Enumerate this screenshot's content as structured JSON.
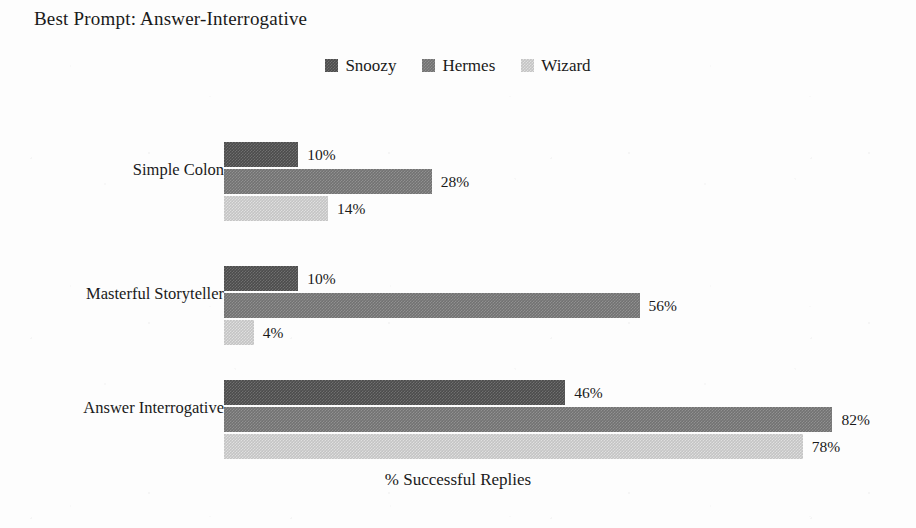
{
  "chart_data": {
    "type": "bar",
    "orientation": "horizontal",
    "title": "Best Prompt: Answer-Interrogative",
    "xlabel": "% Successful Replies",
    "ylabel": "",
    "xlim": [
      0,
      90
    ],
    "grid": false,
    "legend_position": "top-center",
    "value_label_suffix": "%",
    "categories": [
      "Simple Colon",
      "Masterful Storyteller",
      "Answer Interrogative"
    ],
    "series": [
      {
        "name": "Snoozy",
        "color": "#4c4c4c",
        "values": [
          10,
          28,
          46
        ]
      },
      {
        "name": "Hermes",
        "color": "#727272",
        "values": [
          10,
          56,
          82
        ]
      },
      {
        "name": "Wizard",
        "color": "#c4c4c4",
        "values": [
          14,
          4,
          78
        ]
      }
    ],
    "groups": [
      {
        "category": "Simple Colon",
        "bars": [
          {
            "series": "Snoozy",
            "value": 10,
            "label": "10%"
          },
          {
            "series": "Hermes",
            "value": 28,
            "label": "28%"
          },
          {
            "series": "Wizard",
            "value": 14,
            "label": "14%"
          }
        ]
      },
      {
        "category": "Masterful Storyteller",
        "bars": [
          {
            "series": "Snoozy",
            "value": 10,
            "label": "10%"
          },
          {
            "series": "Hermes",
            "value": 56,
            "label": "56%"
          },
          {
            "series": "Wizard",
            "value": 4,
            "label": "4%"
          }
        ]
      },
      {
        "category": "Answer Interrogative",
        "bars": [
          {
            "series": "Snoozy",
            "value": 46,
            "label": "46%"
          },
          {
            "series": "Hermes",
            "value": 82,
            "label": "82%"
          },
          {
            "series": "Wizard",
            "value": 78,
            "label": "78%"
          }
        ]
      }
    ]
  },
  "legend": {
    "items": [
      {
        "label": "Snoozy",
        "color": "#4c4c4c",
        "swatch_icon": "square-swatch-icon"
      },
      {
        "label": "Hermes",
        "color": "#727272",
        "swatch_icon": "square-swatch-icon"
      },
      {
        "label": "Wizard",
        "color": "#c4c4c4",
        "swatch_icon": "square-swatch-icon"
      }
    ]
  },
  "layout": {
    "bar_origin_x": 224,
    "px_per_percent": 7.42,
    "bar_height": 25,
    "bar_gap": 2,
    "group_tops": [
      142,
      266,
      380
    ]
  }
}
